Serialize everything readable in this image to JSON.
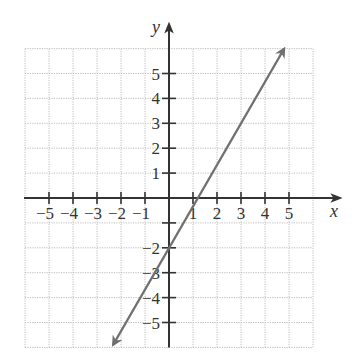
{
  "chart_data": {
    "type": "line",
    "title": "",
    "xlabel": "x",
    "ylabel": "y",
    "xlim": [
      -6,
      6
    ],
    "ylim": [
      -6,
      6
    ],
    "grid": true,
    "grid_style": "dotted",
    "x_ticks": [
      -5,
      -4,
      -3,
      -2,
      -1,
      1,
      2,
      3,
      4,
      5
    ],
    "x_tick_labels": [
      "−5",
      "−4",
      "−3",
      "−2",
      "−1",
      "1",
      "2",
      "3",
      "4",
      "5"
    ],
    "y_ticks": [
      5,
      4,
      3,
      2,
      1,
      -1,
      -2,
      -3,
      -4,
      -5
    ],
    "y_tick_labels": [
      "5",
      "4",
      "3",
      "2",
      "1",
      "",
      "−2",
      "−3",
      "−4",
      "−5"
    ],
    "series": [
      {
        "name": "line",
        "equation": "y = (5/3)x - 2",
        "slope": 1.6667,
        "intercept": -2,
        "x": [
          -2.33,
          4.8
        ],
        "y": [
          -5.9,
          6.0
        ],
        "arrows": "both",
        "color": "#707070"
      }
    ],
    "legend": null
  },
  "colors": {
    "axis": "#333333",
    "grid": "#bdbdbd",
    "line": "#707070",
    "background": "#ffffff"
  }
}
